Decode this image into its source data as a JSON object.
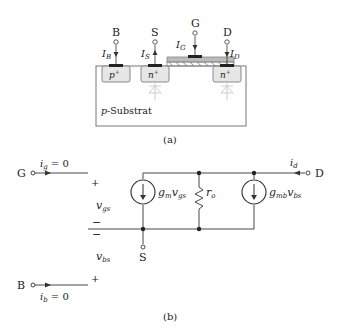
{
  "part_a": {
    "caption": "(a)",
    "terminals": [
      {
        "label": "B",
        "current": "I",
        "sub": "B"
      },
      {
        "label": "S",
        "current": "I",
        "sub": "S"
      },
      {
        "label": "G",
        "current": "I",
        "sub": "G"
      },
      {
        "label": "D",
        "current": "I",
        "sub": "D"
      }
    ],
    "regions": {
      "body_contact": "p",
      "source": "n",
      "drain": "n",
      "superscript": "+"
    },
    "substrate_prefix": "p",
    "substrate_label": "-Substrat"
  },
  "part_b": {
    "caption": "(b)",
    "gate": {
      "label": "G",
      "current": "i",
      "sub": "g",
      "eq": " = 0"
    },
    "drain": {
      "label": "D",
      "current": "i",
      "sub": "d"
    },
    "source": {
      "label": "S"
    },
    "bulk": {
      "label": "B",
      "current": "i",
      "sub": "b",
      "eq": " = 0"
    },
    "vgs": {
      "v": "v",
      "sub": "gs",
      "plus": "+",
      "minus": "−"
    },
    "vbs": {
      "v": "v",
      "sub": "bs",
      "plus": "+",
      "minus": "−"
    },
    "gm_source": {
      "g": "g",
      "gsub": "m",
      "v": "v",
      "vsub": "gs"
    },
    "ro": {
      "r": "r",
      "sub": "o"
    },
    "gmb_source": {
      "g": "g",
      "gsub": "mb",
      "v": "v",
      "vsub": "bs"
    }
  }
}
